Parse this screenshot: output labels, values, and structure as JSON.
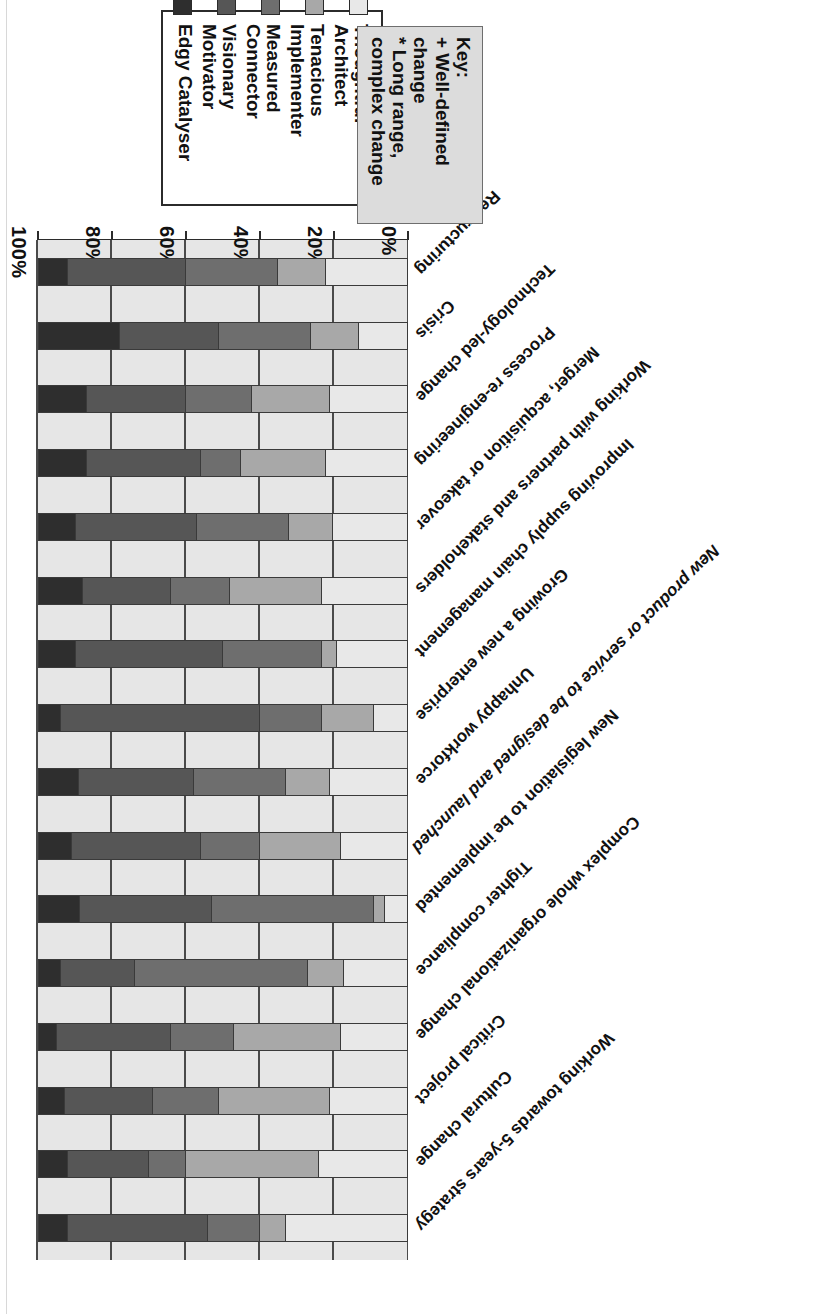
{
  "figure": {
    "orientation_note": "rotated-180",
    "axis": {
      "ticklabels": [
        "0%",
        "20%",
        "40%",
        "60%",
        "80%",
        "100%"
      ],
      "tick_values": [
        0,
        20,
        40,
        60,
        80,
        100
      ],
      "axis_min": 0,
      "axis_max": 100
    }
  },
  "legend": {
    "items": [
      {
        "label": "Thoughtful Architect",
        "color": "#e8e8e8"
      },
      {
        "label": "Tenacious\nImplementer",
        "color": "#a8a8a8"
      },
      {
        "label": "Measured Connector",
        "color": "#6e6e6e"
      },
      {
        "label": "Visionary Motivator",
        "color": "#565656"
      },
      {
        "label": "Edgy Catalyser",
        "color": "#2e2e2e"
      }
    ]
  },
  "key": {
    "title": "Key:",
    "lines": [
      "+ Well-defined\nchange",
      "* Long range,\ncomplex change"
    ]
  },
  "chart_data": {
    "type": "bar",
    "subtype": "stacked-100-horizontal",
    "title": "",
    "xlabel": "",
    "ylabel": "",
    "xlim": [
      0,
      100
    ],
    "grid": true,
    "legend_position": "top-right",
    "series_names": [
      "Thoughtful Architect",
      "Tenacious Implementer",
      "Measured Connector",
      "Visionary Motivator",
      "Edgy Catalyser"
    ],
    "series_colors": [
      "#e8e8e8",
      "#a8a8a8",
      "#6e6e6e",
      "#565656",
      "#2e2e2e"
    ],
    "categories": [
      "Restructuring",
      "Crisis",
      "Technology-led change",
      "Process re-engineering",
      "Merger, acquisition or takeover",
      "Working with partners and stakeholders",
      "Improving supply chain management",
      "Growing a new enterprise",
      "Unhappy workforce",
      "New product or service to be designed and launched",
      "New legislation to be implemented",
      "Tighter compliance",
      "Complex whole organizational change",
      "Critical project",
      "Cultural change",
      "Working towards 5-years strategy"
    ],
    "categories_italic": [
      "New product or service to be designed and launched"
    ],
    "series": [
      {
        "name": "Thoughtful Architect",
        "values": [
          22,
          13,
          21,
          22,
          20,
          23,
          19,
          9,
          21,
          18,
          6,
          17,
          18,
          21,
          24,
          33
        ]
      },
      {
        "name": "Tenacious Implementer",
        "values": [
          13,
          13,
          21,
          23,
          12,
          25,
          4,
          14,
          12,
          22,
          3,
          10,
          29,
          30,
          36,
          7
        ]
      },
      {
        "name": "Measured Connector",
        "values": [
          25,
          25,
          18,
          11,
          25,
          16,
          27,
          17,
          25,
          16,
          44,
          47,
          17,
          18,
          10,
          14
        ]
      },
      {
        "name": "Visionary Motivator",
        "values": [
          32,
          27,
          27,
          31,
          33,
          24,
          40,
          54,
          31,
          35,
          36,
          20,
          31,
          24,
          22,
          38
        ]
      },
      {
        "name": "Edgy Catalyser",
        "values": [
          8,
          22,
          13,
          13,
          10,
          12,
          10,
          6,
          11,
          9,
          11,
          6,
          5,
          7,
          8,
          8
        ]
      }
    ]
  }
}
